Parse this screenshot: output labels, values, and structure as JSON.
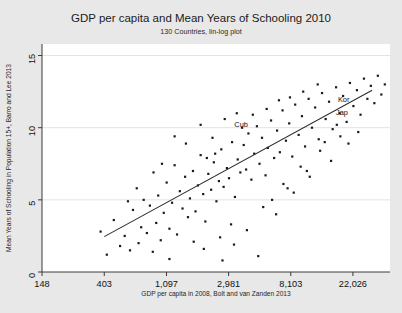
{
  "chart_data": {
    "type": "scatter",
    "title": "GDP per capita and Mean Years of Schooling 2010",
    "subtitle": "130 Countries, lin-log plot",
    "xlabel": "GDP per capita in 2008, Bolt and van Zanden 2013",
    "ylabel": "Mean Years of Schooling in Population 15+, Barro and Lee 2013",
    "x_scale": "log",
    "y_scale": "linear",
    "xticks": [
      148,
      403,
      1097,
      2981,
      8103,
      22026
    ],
    "xtick_labels": [
      "148",
      "403",
      "1,097",
      "2,981",
      "8,103",
      "22,026"
    ],
    "yticks": [
      0,
      5,
      10,
      15
    ],
    "ytick_labels": [
      "0",
      "5",
      "10",
      "15"
    ],
    "xlim": [
      148,
      40000
    ],
    "ylim": [
      0,
      15.8
    ],
    "grid": "horizontal",
    "legend": "none",
    "n_points": 130,
    "marker_color": "#1a1a1a",
    "line_color": "#2b2b2b",
    "background_color": "#ffffff",
    "figure_background_color": "#e8e8e8",
    "fit_line": {
      "label": "linear fit on log(GDP)",
      "x_start": 403,
      "y_start": 2.45,
      "x_end": 30000,
      "y_end": 12.6
    },
    "annotations": [
      {
        "label": "Cub",
        "x": 4200,
        "y": 10.25
      },
      {
        "label": "Kor",
        "x": 21500,
        "y": 11.95
      },
      {
        "label": "Jap",
        "x": 21000,
        "y": 11.05
      }
    ],
    "points": [
      {
        "x": 470,
        "y": 3.6
      },
      {
        "x": 520,
        "y": 1.8
      },
      {
        "x": 560,
        "y": 2.5
      },
      {
        "x": 610,
        "y": 1.5
      },
      {
        "x": 640,
        "y": 4.3
      },
      {
        "x": 700,
        "y": 2.0
      },
      {
        "x": 730,
        "y": 3.1
      },
      {
        "x": 760,
        "y": 5.0
      },
      {
        "x": 800,
        "y": 2.7
      },
      {
        "x": 840,
        "y": 4.6
      },
      {
        "x": 880,
        "y": 1.4
      },
      {
        "x": 930,
        "y": 3.4
      },
      {
        "x": 960,
        "y": 5.3
      },
      {
        "x": 1000,
        "y": 2.2
      },
      {
        "x": 1050,
        "y": 4.1
      },
      {
        "x": 1100,
        "y": 6.2
      },
      {
        "x": 1150,
        "y": 3.0
      },
      {
        "x": 1200,
        "y": 4.8
      },
      {
        "x": 1250,
        "y": 7.4
      },
      {
        "x": 1300,
        "y": 2.6
      },
      {
        "x": 1360,
        "y": 5.6
      },
      {
        "x": 1420,
        "y": 4.4
      },
      {
        "x": 1480,
        "y": 6.6
      },
      {
        "x": 1550,
        "y": 3.8
      },
      {
        "x": 1600,
        "y": 5.1
      },
      {
        "x": 1680,
        "y": 7.0
      },
      {
        "x": 1750,
        "y": 4.2
      },
      {
        "x": 1820,
        "y": 6.0
      },
      {
        "x": 1900,
        "y": 8.1
      },
      {
        "x": 1980,
        "y": 5.4
      },
      {
        "x": 2050,
        "y": 3.5
      },
      {
        "x": 2150,
        "y": 6.8
      },
      {
        "x": 2250,
        "y": 5.7
      },
      {
        "x": 2350,
        "y": 7.6
      },
      {
        "x": 2450,
        "y": 4.9
      },
      {
        "x": 2550,
        "y": 6.3
      },
      {
        "x": 2650,
        "y": 8.5
      },
      {
        "x": 2750,
        "y": 5.9
      },
      {
        "x": 2900,
        "y": 7.2
      },
      {
        "x": 3000,
        "y": 6.5
      },
      {
        "x": 3150,
        "y": 9.0
      },
      {
        "x": 3300,
        "y": 5.2
      },
      {
        "x": 3450,
        "y": 7.8
      },
      {
        "x": 3600,
        "y": 6.9
      },
      {
        "x": 3800,
        "y": 8.8
      },
      {
        "x": 3950,
        "y": 7.1
      },
      {
        "x": 4100,
        "y": 9.6
      },
      {
        "x": 4300,
        "y": 6.4
      },
      {
        "x": 4500,
        "y": 8.2
      },
      {
        "x": 4700,
        "y": 10.1
      },
      {
        "x": 4900,
        "y": 7.5
      },
      {
        "x": 5100,
        "y": 9.3
      },
      {
        "x": 5400,
        "y": 6.7
      },
      {
        "x": 5600,
        "y": 8.6
      },
      {
        "x": 5900,
        "y": 10.5
      },
      {
        "x": 6200,
        "y": 7.9
      },
      {
        "x": 6500,
        "y": 9.8
      },
      {
        "x": 6800,
        "y": 8.3
      },
      {
        "x": 7100,
        "y": 11.2
      },
      {
        "x": 7500,
        "y": 9.1
      },
      {
        "x": 7900,
        "y": 10.3
      },
      {
        "x": 8300,
        "y": 8.0
      },
      {
        "x": 8700,
        "y": 11.6
      },
      {
        "x": 9200,
        "y": 9.5
      },
      {
        "x": 9700,
        "y": 10.8
      },
      {
        "x": 10200,
        "y": 8.7
      },
      {
        "x": 10800,
        "y": 12.0
      },
      {
        "x": 11400,
        "y": 10.0
      },
      {
        "x": 12000,
        "y": 11.4
      },
      {
        "x": 12700,
        "y": 9.2
      },
      {
        "x": 13400,
        "y": 12.4
      },
      {
        "x": 14200,
        "y": 10.6
      },
      {
        "x": 15000,
        "y": 11.8
      },
      {
        "x": 15900,
        "y": 9.9
      },
      {
        "x": 16800,
        "y": 12.8
      },
      {
        "x": 17800,
        "y": 11.0
      },
      {
        "x": 18800,
        "y": 12.2
      },
      {
        "x": 19900,
        "y": 10.4
      },
      {
        "x": 21000,
        "y": 13.1
      },
      {
        "x": 22200,
        "y": 11.5
      },
      {
        "x": 23500,
        "y": 12.6
      },
      {
        "x": 24900,
        "y": 10.9
      },
      {
        "x": 26300,
        "y": 13.4
      },
      {
        "x": 27800,
        "y": 12.0
      },
      {
        "x": 29400,
        "y": 12.9
      },
      {
        "x": 31100,
        "y": 11.7
      },
      {
        "x": 32900,
        "y": 13.6
      },
      {
        "x": 34800,
        "y": 12.3
      },
      {
        "x": 36800,
        "y": 13.0
      },
      {
        "x": 380,
        "y": 2.8
      },
      {
        "x": 420,
        "y": 1.2
      },
      {
        "x": 1700,
        "y": 2.1
      },
      {
        "x": 2000,
        "y": 1.6
      },
      {
        "x": 2600,
        "y": 2.4
      },
      {
        "x": 3100,
        "y": 3.3
      },
      {
        "x": 4000,
        "y": 2.9
      },
      {
        "x": 5200,
        "y": 4.5
      },
      {
        "x": 6000,
        "y": 5.0
      },
      {
        "x": 7200,
        "y": 6.1
      },
      {
        "x": 8500,
        "y": 5.5
      },
      {
        "x": 9500,
        "y": 7.3
      },
      {
        "x": 11000,
        "y": 6.6
      },
      {
        "x": 13000,
        "y": 8.4
      },
      {
        "x": 15500,
        "y": 7.7
      },
      {
        "x": 18000,
        "y": 9.4
      },
      {
        "x": 20500,
        "y": 8.9
      },
      {
        "x": 24000,
        "y": 9.7
      },
      {
        "x": 1900,
        "y": 10.2
      },
      {
        "x": 2300,
        "y": 9.3
      },
      {
        "x": 2800,
        "y": 10.6
      },
      {
        "x": 3400,
        "y": 11.0
      },
      {
        "x": 4400,
        "y": 10.9
      },
      {
        "x": 5500,
        "y": 11.3
      },
      {
        "x": 6700,
        "y": 11.9
      },
      {
        "x": 8000,
        "y": 12.1
      },
      {
        "x": 9900,
        "y": 12.5
      },
      {
        "x": 12500,
        "y": 13.0
      },
      {
        "x": 1500,
        "y": 8.9
      },
      {
        "x": 1250,
        "y": 9.4
      },
      {
        "x": 3700,
        "y": 10.0
      },
      {
        "x": 2100,
        "y": 7.9
      },
      {
        "x": 2400,
        "y": 8.2
      },
      {
        "x": 6400,
        "y": 4.0
      },
      {
        "x": 7700,
        "y": 5.8
      },
      {
        "x": 10500,
        "y": 7.0
      },
      {
        "x": 14000,
        "y": 9.0
      },
      {
        "x": 17000,
        "y": 10.2
      },
      {
        "x": 890,
        "y": 6.9
      },
      {
        "x": 1020,
        "y": 7.5
      },
      {
        "x": 680,
        "y": 5.8
      },
      {
        "x": 590,
        "y": 4.9
      },
      {
        "x": 1150,
        "y": 0.9
      },
      {
        "x": 2700,
        "y": 0.8
      },
      {
        "x": 4800,
        "y": 1.1
      },
      {
        "x": 3250,
        "y": 1.9
      }
    ]
  }
}
